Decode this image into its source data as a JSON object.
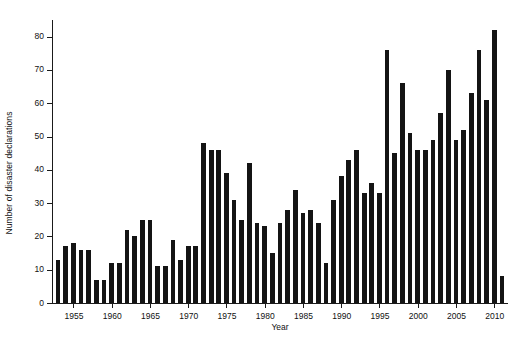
{
  "chart_data": {
    "type": "bar",
    "title": "",
    "xlabel": "Year",
    "ylabel": "Number of disaster declarations",
    "xlim": [
      1952.2,
      2011.8
    ],
    "ylim": [
      0,
      85
    ],
    "yticks": [
      0,
      10,
      20,
      30,
      40,
      50,
      60,
      70,
      80
    ],
    "xticks": [
      1955,
      1960,
      1965,
      1970,
      1975,
      1980,
      1985,
      1990,
      1995,
      2000,
      2005,
      2010
    ],
    "grid": false,
    "legend": null,
    "bar_color": "#141414",
    "axis_color": "#1a1a1a",
    "categories": [
      1953,
      1954,
      1955,
      1956,
      1957,
      1958,
      1959,
      1960,
      1961,
      1962,
      1963,
      1964,
      1965,
      1966,
      1967,
      1968,
      1969,
      1970,
      1971,
      1972,
      1973,
      1974,
      1975,
      1976,
      1977,
      1978,
      1979,
      1980,
      1981,
      1982,
      1983,
      1984,
      1985,
      1986,
      1987,
      1988,
      1989,
      1990,
      1991,
      1992,
      1993,
      1994,
      1995,
      1996,
      1997,
      1998,
      1999,
      2000,
      2001,
      2002,
      2003,
      2004,
      2005,
      2006,
      2007,
      2008,
      2009,
      2010,
      2011
    ],
    "values": [
      13,
      17,
      18,
      16,
      16,
      7,
      7,
      12,
      12,
      22,
      20,
      25,
      25,
      11,
      11,
      19,
      13,
      17,
      17,
      48,
      46,
      46,
      39,
      31,
      25,
      42,
      24,
      23,
      15,
      24,
      28,
      34,
      27,
      28,
      24,
      12,
      31,
      38,
      43,
      46,
      33,
      36,
      33,
      76,
      45,
      66,
      51,
      46,
      46,
      49,
      57,
      70,
      49,
      52,
      63,
      76,
      61,
      82,
      8
    ]
  }
}
